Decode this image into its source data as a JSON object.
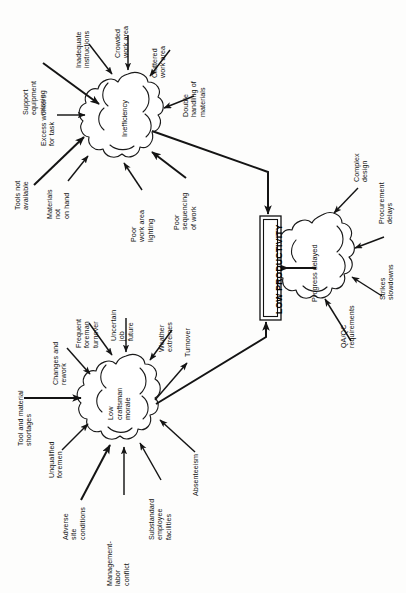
{
  "diagram": {
    "orientation": "rotated-90-ccw",
    "outcome": {
      "label": "LOW PRODUCTIVITY",
      "shape": "double-rectangle"
    },
    "clusters": [
      {
        "id": "inefficiency",
        "label": "Inefficiency",
        "causes": [
          "Support\nequipment\nmissing",
          "Inadequate\ninstructions",
          "Crowded\nwork area",
          "Cluttered\nwork area",
          "Double\nhandling of\nmaterials",
          "Excess workers\nfor task",
          "Tools not\navailable",
          "Materials\nnot\non hand",
          "Poor\nwork area\nlighting",
          "Poor\nsequencing\nof work"
        ]
      },
      {
        "id": "low-craftsman-morale",
        "label": "Low\ncraftsman\nmorale",
        "causes": [
          "Frequent\nforeman\nturnover",
          "Uncertain\njob\nfuture",
          "Weather\nextremes",
          "Changes and\nrework",
          "Tool and material\nshortages",
          "Unqualified\nforemen",
          "Adverse\nsite\nconditions",
          "Management-\nlabor\nconflict",
          "Substandard\nemployee\nfacilities",
          "Absenteeism"
        ],
        "effects": [
          "Turnover"
        ]
      },
      {
        "id": "progress-delayed",
        "label": "Progress delayed",
        "causes": [
          "Complex\ndesign",
          "Procurement\ndelays",
          "Strikes\nslowdowns",
          "QA/QC\nrequirements"
        ]
      }
    ],
    "colors": {
      "stroke": "#141414",
      "background": "#fdfdfc",
      "text": "#111111"
    }
  },
  "labels": {
    "support_equipment_missing": "Support\nequipment\nmissing",
    "inadequate_instructions": "Inadequate\ninstructions",
    "crowded_work_area": "Crowded\nwork area",
    "cluttered_work_area": "Cluttered\nwork area",
    "double_handling": "Double\nhandling of\nmaterials",
    "excess_workers": "Excess workers\nfor task",
    "tools_not_available": "Tools not\navailable",
    "materials_not_on_hand": "Materials\nnot\non hand",
    "poor_lighting": "Poor\nwork area\nlighting",
    "poor_sequencing": "Poor\nsequencing\nof work",
    "inefficiency": "Inefficiency",
    "frequent_foreman_turnover": "Frequent\nforeman\nturnover",
    "uncertain_job_future": "Uncertain\njob\nfuture",
    "weather_extremes": "Weather\nextremes",
    "turnover": "Turnover",
    "changes_and_rework": "Changes and\nrework",
    "tool_material_shortages": "Tool and material\nshortages",
    "unqualified_foremen": "Unqualified\nforemen",
    "adverse_site_conditions": "Adverse\nsite\nconditions",
    "management_labor_conflict": "Management-\nlabor\nconflict",
    "substandard_facilities": "Substandard\nemployee\nfacilities",
    "absenteeism": "Absenteeism",
    "low_craftsman_morale": "Low\ncraftsman\nmorale",
    "complex_design": "Complex\ndesign",
    "procurement_delays": "Procurement\ndelays",
    "strikes_slowdowns": "Strikes\nslowdowns",
    "qa_qc_requirements": "QA/QC\nrequirements",
    "progress_delayed": "Progress delayed",
    "low_productivity": "LOW PRODUCTIVITY"
  }
}
